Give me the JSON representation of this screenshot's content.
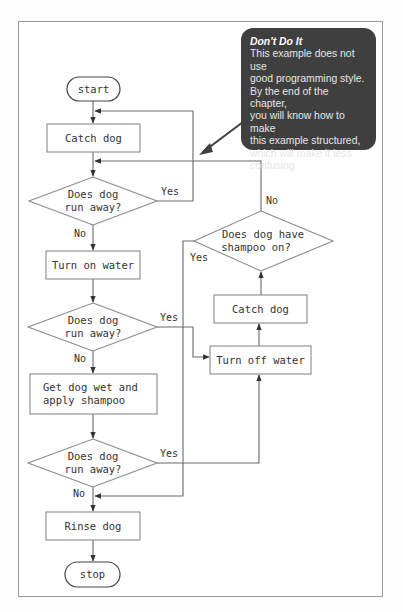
{
  "callout": {
    "title": "Don't Do It",
    "lines": [
      "This example does not use",
      "good programming style.",
      "By the end of the chapter,",
      "you will know how to make",
      "this example structured,",
      "which will make it less",
      "confusing."
    ],
    "background": "#3f3f3f"
  },
  "flowchart": {
    "terminals": {
      "start": "start",
      "stop": "stop"
    },
    "processes": {
      "catch_dog_1": "Catch dog",
      "turn_on_water": "Turn on water",
      "get_dog_wet_line1": "Get dog wet and",
      "get_dog_wet_line2": "apply shampoo",
      "rinse_dog": "Rinse dog",
      "catch_dog_2": "Catch dog",
      "turn_off_water": "Turn off water"
    },
    "decisions": {
      "run_away_1_line1": "Does dog",
      "run_away_1_line2": "run away?",
      "run_away_2_line1": "Does dog",
      "run_away_2_line2": "run away?",
      "run_away_3_line1": "Does dog",
      "run_away_3_line2": "run away?",
      "shampoo_on_line1": "Does dog have",
      "shampoo_on_line2": "shampoo on?"
    },
    "branch_labels": {
      "d1_yes": "Yes",
      "d1_no": "No",
      "d2_yes": "Yes",
      "d2_no": "No",
      "d3_yes": "Yes",
      "d3_no": "No",
      "shampoo_yes": "Yes",
      "shampoo_no": "No"
    }
  }
}
